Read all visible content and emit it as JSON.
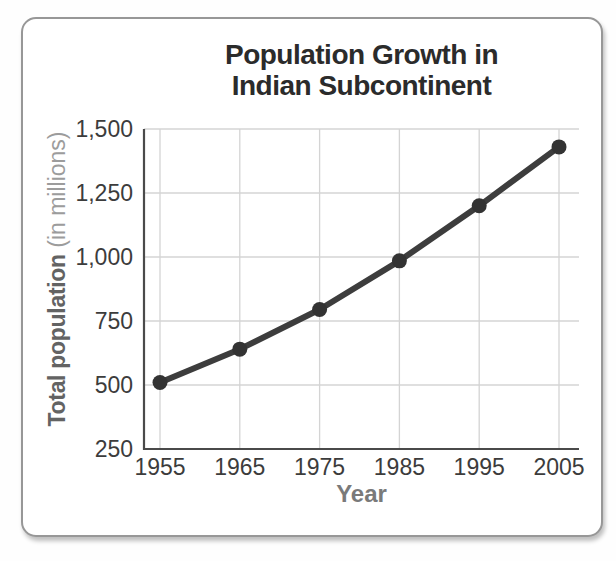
{
  "page": {
    "background": "#fefefe"
  },
  "card": {
    "background": "#ffffff",
    "border_color": "#979797"
  },
  "chart_data": {
    "type": "line",
    "title": "Population Growth in Indian Subcontinent",
    "title_lines": [
      "Population Growth in",
      "Indian Subcontinent"
    ],
    "xlabel": "Year",
    "ylabel": "Total population (in millions)",
    "ylabel_bold": "Total population",
    "ylabel_light": "(in millions)",
    "x": [
      1955,
      1965,
      1975,
      1985,
      1995,
      2005
    ],
    "x_tick_labels": [
      "1955",
      "1965",
      "1975",
      "1985",
      "1995",
      "2005"
    ],
    "values": [
      510,
      640,
      795,
      985,
      1200,
      1430
    ],
    "series_name": "Total population",
    "ylim": [
      250,
      1500
    ],
    "y_ticks": [
      1500,
      1250,
      1000,
      750,
      500,
      250
    ],
    "y_tick_labels": [
      "1,500",
      "1,250",
      "1,000",
      "750",
      "500",
      "250"
    ],
    "grid": true,
    "legend": "none",
    "colors": {
      "line": "#3d3d3d",
      "marker": "#333333",
      "grid": "#d4d4d4",
      "axis": "#4a4a4a",
      "tick_label": "#3c3c3c",
      "title": "#2b2b2b",
      "xlabel": "#7a7a7a",
      "ylabel_bold": "#636363",
      "ylabel_light": "#9c9c9c"
    }
  }
}
